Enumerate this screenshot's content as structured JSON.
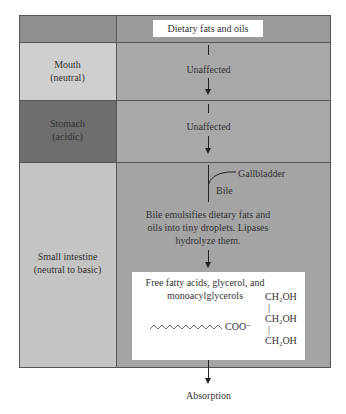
{
  "diagram": {
    "title_box": "Dietary fats and oils",
    "rows": [
      {
        "region": "Mouth",
        "condition": "(neutral)",
        "effect": "Unaffected"
      },
      {
        "region": "Stomach",
        "condition": "(acidic)",
        "effect": "Unaffected"
      },
      {
        "region": "Small intestine",
        "condition": "(neutral to basic)",
        "effect": ""
      }
    ],
    "gallbladder_label": "Gallbladder",
    "bile_label": "Bile",
    "emulsify_lines": [
      "Bile emulsifies dietary fats and",
      "oils into tiny droplets. Lipases",
      "hydrolyze them."
    ],
    "products_box": {
      "lines": [
        "Free fatty acids, glycerol, and",
        "monoacylglycerols"
      ],
      "fatty_acid_end": "COO⁻",
      "glycerol": [
        "CH₂OH",
        "|",
        "CH₂OH",
        "|",
        "CH₂OH"
      ]
    },
    "final_label": "Absorption",
    "colors": {
      "header_left": "#8f8f8f",
      "header_right": "#9a9a9a",
      "mouth_left": "#cfcfcf",
      "mouth_right": "#a8a8a8",
      "stomach_left": "#6e6e6e",
      "stomach_right": "#a8a8a8",
      "intestine_left": "#c4c4c4",
      "intestine_right": "#a4a4a4"
    }
  }
}
